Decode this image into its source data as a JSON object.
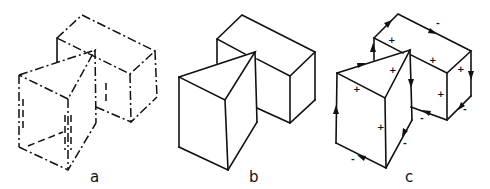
{
  "figure": {
    "panels": [
      {
        "id": "a",
        "label": "a",
        "style": "dash-dot (hidden/construction lines shown)"
      },
      {
        "id": "b",
        "label": "b",
        "style": "solid outline"
      },
      {
        "id": "c",
        "label": "c",
        "style": "solid outline with oriented edge arrows and face signs"
      }
    ],
    "panel_c": {
      "face_signs": [
        "+",
        "+",
        "+",
        "+",
        "+",
        "+",
        "+"
      ],
      "edge_signs": [
        "-",
        "-",
        "-",
        "-",
        "-",
        "-"
      ]
    },
    "colors": {
      "ink": "#111111",
      "background": "#ffffff"
    }
  }
}
